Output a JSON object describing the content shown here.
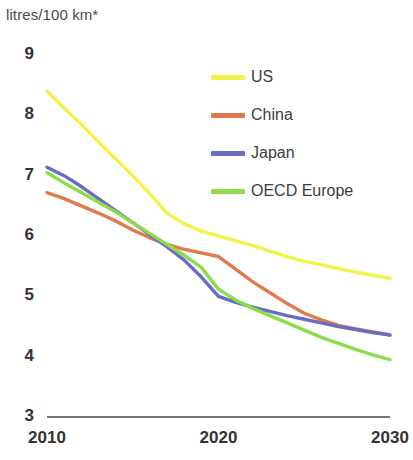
{
  "chart_data": {
    "type": "line",
    "title": "litres/100 km*",
    "xlabel": "",
    "ylabel": "litres/100 km*",
    "x": [
      2010,
      2011,
      2012,
      2013,
      2014,
      2015,
      2016,
      2017,
      2018,
      2019,
      2020,
      2021,
      2022,
      2023,
      2024,
      2025,
      2026,
      2027,
      2028,
      2029,
      2030
    ],
    "xlim": [
      2010,
      2030
    ],
    "ylim": [
      3,
      9
    ],
    "xticks": [
      2010,
      2020,
      2030
    ],
    "xtick_labels": [
      "2010",
      "2020",
      "2030"
    ],
    "yticks": [
      3,
      4,
      5,
      6,
      7,
      8,
      9
    ],
    "ytick_labels": [
      "3",
      "4",
      "5",
      "6",
      "7",
      "8",
      "9"
    ],
    "grid": false,
    "legend_position": "upper-right",
    "series": [
      {
        "name": "US",
        "color": "#f2f24a",
        "values": [
          8.4,
          8.12,
          7.85,
          7.56,
          7.28,
          7.0,
          6.7,
          6.38,
          6.2,
          6.08,
          6.0,
          5.92,
          5.84,
          5.75,
          5.66,
          5.58,
          5.52,
          5.46,
          5.4,
          5.35,
          5.3
        ]
      },
      {
        "name": "China",
        "color": "#e07a4f",
        "values": [
          6.72,
          6.62,
          6.5,
          6.38,
          6.25,
          6.1,
          5.97,
          5.86,
          5.78,
          5.72,
          5.66,
          5.45,
          5.24,
          5.06,
          4.88,
          4.72,
          4.61,
          4.52,
          4.46,
          4.41,
          4.36
        ]
      },
      {
        "name": "Japan",
        "color": "#6b6bc4",
        "values": [
          7.14,
          7.0,
          6.82,
          6.62,
          6.42,
          6.22,
          6.02,
          5.82,
          5.6,
          5.32,
          5.0,
          4.9,
          4.82,
          4.75,
          4.68,
          4.62,
          4.56,
          4.5,
          4.45,
          4.4,
          4.36
        ]
      },
      {
        "name": "OECD Europe",
        "color": "#8ddc4a",
        "values": [
          7.05,
          6.88,
          6.72,
          6.56,
          6.4,
          6.22,
          6.04,
          5.86,
          5.68,
          5.48,
          5.12,
          4.94,
          4.8,
          4.68,
          4.56,
          4.44,
          4.32,
          4.22,
          4.12,
          4.03,
          3.95
        ]
      }
    ]
  },
  "legend": {
    "items": [
      {
        "label": "US",
        "color": "#f2f24a"
      },
      {
        "label": "China",
        "color": "#e07a4f"
      },
      {
        "label": "Japan",
        "color": "#6b6bc4"
      },
      {
        "label": "OECD Europe",
        "color": "#8ddc4a"
      }
    ]
  },
  "axis": {
    "line_color": "#4a4a4a"
  }
}
